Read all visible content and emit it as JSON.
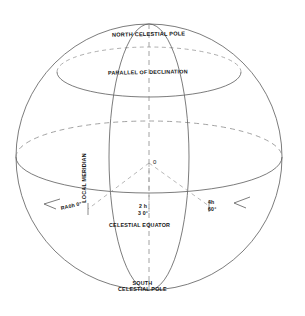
{
  "figure": {
    "background_color": "#ffffff",
    "line_color": "#5a5a5a",
    "dash_color": "#8c8c8c",
    "text_color": "#141414",
    "width": 305,
    "height": 316
  },
  "labels": {
    "north_pole": "NORTH CELESTIAL POLE",
    "parallel_of_declination": "PARALLEL OF DECLINATION",
    "local_meridian": "LOCAL MERIDIAN",
    "celestial_equator": "CELESTIAL EQUATOR",
    "south_pole_line1": "SOUTH",
    "south_pole_line2": "CELESTIAL POLE",
    "origin": "0"
  },
  "coordinates": {
    "ra_zero": "RA0h 0°",
    "ra_two_hours": "2 h",
    "dec_thirty": "3 0°",
    "ra_four_hours": "4h",
    "dec_sixty": "60°"
  },
  "geometry": {
    "sphere_center_x": 149,
    "sphere_center_y": 157,
    "sphere_radius_x": 133,
    "sphere_radius_y": 133,
    "equator_rx": 133,
    "equator_ry": 36,
    "parallel_rx": 92,
    "parallel_ry": 25,
    "parallel_center_y": 72,
    "meridian_left_rx": 40,
    "meridian_right_rx": 40
  },
  "arrows": {
    "left_arrow_direction": "west",
    "right_arrow_direction": "west",
    "count": 2
  }
}
